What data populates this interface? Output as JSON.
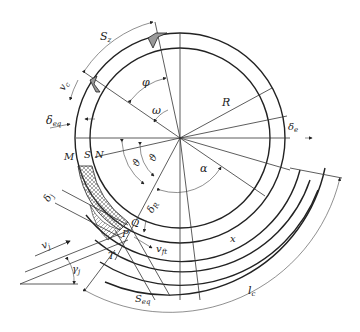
{
  "labels": {
    "S_z": "S",
    "S_z_sub": "z",
    "v_c": "v",
    "v_c_sub": "c",
    "phi": "φ",
    "omega": "ω",
    "R": "R",
    "delta_eq": "δ",
    "delta_eq_sub": "eq",
    "delta_e": "δ",
    "delta_e_sub": "e",
    "M": "M",
    "S": "S",
    "N": "N",
    "theta": "ϑ",
    "theta2": "ϑ",
    "alpha": "α",
    "delta_j": "δ",
    "delta_j_sub": "j",
    "delta_R": "δ",
    "delta_R_sub": "R",
    "Q": "Q",
    "P": "P",
    "T": "T",
    "v_j": "v",
    "v_j_sub": "j",
    "v_ft": "v",
    "v_ft_sub": "ft",
    "gamma_j": "γ",
    "gamma_j_sub": "j",
    "x": "x",
    "S_eq": "S",
    "S_eq_sub": "eq",
    "l_c": "l",
    "l_c_sub": "c"
  },
  "colors": {
    "line": "#333333",
    "hatch": "#555555",
    "background": "#ffffff"
  }
}
